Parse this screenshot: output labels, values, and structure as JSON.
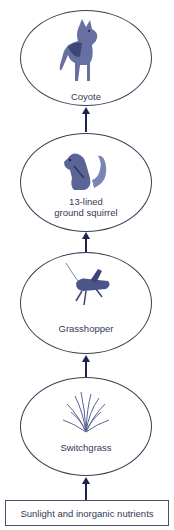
{
  "diagram": {
    "type": "food-chain",
    "direction": "bottom-to-top",
    "nodes": [
      {
        "id": "coyote",
        "label": "Coyote",
        "icon": "coyote-icon",
        "trophic_level": 4
      },
      {
        "id": "squirrel",
        "label_line1": "13-lined",
        "label_line2": "ground squirrel",
        "icon": "squirrel-icon",
        "trophic_level": 3
      },
      {
        "id": "grasshopper",
        "label": "Grasshopper",
        "icon": "grasshopper-icon",
        "trophic_level": 2
      },
      {
        "id": "switchgrass",
        "label": "Switchgrass",
        "icon": "grass-icon",
        "trophic_level": 1
      }
    ],
    "source": {
      "label": "Sunlight and inorganic nutrients"
    },
    "edges": [
      {
        "from": "source",
        "to": "switchgrass"
      },
      {
        "from": "switchgrass",
        "to": "grasshopper"
      },
      {
        "from": "grasshopper",
        "to": "squirrel"
      },
      {
        "from": "squirrel",
        "to": "coyote"
      }
    ],
    "colors": {
      "outline": "#3b3e55",
      "arrow": "#1d2350",
      "illustration": "#5a6495"
    }
  }
}
